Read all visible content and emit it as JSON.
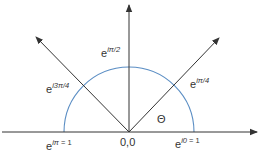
{
  "diagram": {
    "title": "",
    "colors": {
      "axis": "#333333",
      "arc": "#5b8ec4",
      "text": "#333333",
      "background": "#ffffff"
    },
    "axes": {
      "horizontal_arrow": "right",
      "vertical_arrow": "up"
    },
    "rays": [
      {
        "name": "ray-pi-over-4",
        "angle_deg": 45
      },
      {
        "name": "ray-3pi-over-4",
        "angle_deg": 135
      }
    ],
    "arc": {
      "start_deg": 0,
      "end_deg": 180,
      "description": "upper unit semicircle"
    },
    "labels": {
      "origin": "0,0",
      "theta": "Θ",
      "e_i_pi_over_2": {
        "base": "e",
        "exp": "iπ/2"
      },
      "e_i_pi_over_4": {
        "base": "e",
        "exp": "iπ/4"
      },
      "e_i_3pi_over_4": {
        "base": "e",
        "exp": "i3π/4"
      },
      "e_i_pi": {
        "base": "e",
        "exp": "iπ",
        "suffix": " = 1"
      },
      "e_i_0": {
        "base": "e",
        "exp": "i0",
        "suffix": " = 1"
      }
    }
  }
}
